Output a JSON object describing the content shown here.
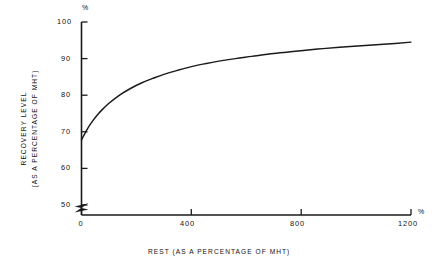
{
  "figure": {
    "background_color": "#ffffff",
    "ink_color": "#1a1a1a",
    "percent_symbol": "%"
  },
  "chart_data": {
    "type": "line",
    "title": "",
    "subtitle": "",
    "xlabel": "REST (AS A PERCENTAGE OF MHT)",
    "ylabel_line1": "RECOVERY LEVEL",
    "ylabel_line2": "(AS A PERCENTAGE OF MHT)",
    "x_unit": "%",
    "y_unit": "%",
    "xlim": [
      0,
      1200
    ],
    "ylim": [
      50,
      100
    ],
    "y_axis_break_below": 50,
    "grid": false,
    "legend": null,
    "xticks": [
      0,
      400,
      800,
      1200
    ],
    "xticklabels": [
      "0",
      "400",
      "800",
      "1200"
    ],
    "yticks": [
      50,
      60,
      70,
      80,
      90,
      100
    ],
    "yticklabels": [
      "50",
      "60",
      "70",
      "80",
      "90",
      "100"
    ],
    "series": [
      {
        "name": "Recovery level vs rest",
        "x": [
          0,
          20,
          40,
          60,
          80,
          100,
          140,
          180,
          220,
          260,
          300,
          350,
          400,
          450,
          500,
          560,
          620,
          700,
          780,
          860,
          940,
          1020,
          1100,
          1200
        ],
        "values": [
          67.8,
          70.6,
          72.9,
          74.8,
          76.4,
          77.8,
          80.1,
          81.9,
          83.4,
          84.6,
          85.7,
          86.8,
          87.8,
          88.6,
          89.3,
          90.0,
          90.6,
          91.4,
          92.0,
          92.6,
          93.1,
          93.5,
          93.9,
          94.5
        ]
      }
    ],
    "annotations": []
  }
}
